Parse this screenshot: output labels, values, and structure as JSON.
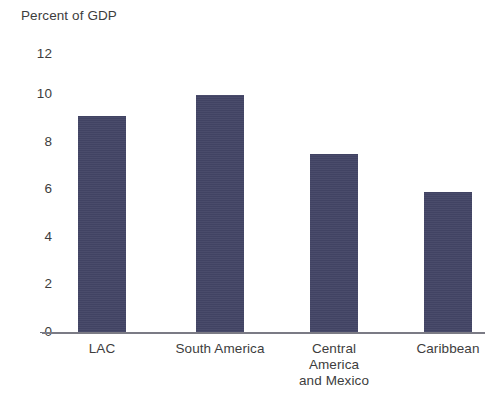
{
  "chart_data": {
    "type": "bar",
    "title": "Percent of GDP",
    "xlabel": "",
    "ylabel": "",
    "ylim": [
      0,
      12
    ],
    "yticks": [
      0,
      2,
      4,
      6,
      8,
      10,
      12
    ],
    "grid": false,
    "legend": null,
    "bar_color": "#434566",
    "axis_color": "#7b7b85",
    "categories": [
      "LAC",
      "South America",
      "Central America and Mexico",
      "Caribbean"
    ],
    "category_lines": [
      [
        "LAC"
      ],
      [
        "South America"
      ],
      [
        "Central",
        "America",
        "and Mexico"
      ],
      [
        "Caribbean"
      ]
    ],
    "values": [
      9.1,
      10.0,
      7.5,
      5.9
    ],
    "ytick_labels": [
      "12",
      "10",
      "8",
      "6",
      "4",
      "2",
      "0"
    ]
  }
}
